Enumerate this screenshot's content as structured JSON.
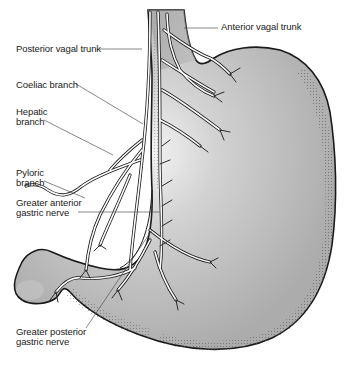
{
  "diagram": {
    "colors": {
      "stomach_fill": "#b4b4b4",
      "stomach_highlight": "#f2f2f2",
      "outline": "#1a1a1a",
      "nerve_fill": "#ffffff",
      "leader_line": "#555555",
      "label_text": "#222222"
    },
    "labels": [
      {
        "id": "anterior-vagal-trunk",
        "text": "Anterior vagal trunk"
      },
      {
        "id": "posterior-vagal-trunk",
        "text": "Posterior vagal trunk"
      },
      {
        "id": "coeliac-branch",
        "text": "Coeliac branch"
      },
      {
        "id": "hepatic-branch",
        "text": "Hepatic\nbranch"
      },
      {
        "id": "pyloric-branch",
        "text": "Pyloric\nbranch"
      },
      {
        "id": "greater-anterior-gastric-nerve",
        "text": "Greater anterior\ngastric nerve"
      },
      {
        "id": "greater-posterior-gastric-nerve",
        "text": "Greater posterior\ngastric nerve"
      }
    ]
  }
}
